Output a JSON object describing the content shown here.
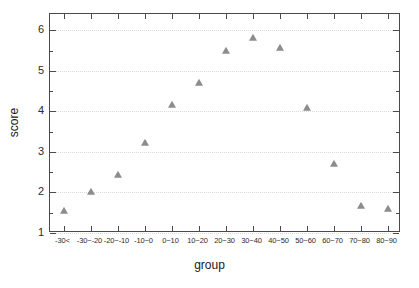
{
  "chart_data": {
    "type": "scatter",
    "title": "",
    "xlabel": "group",
    "ylabel": "score",
    "categories": [
      "-30<",
      "-30~-20",
      "-20~-10",
      "-10~0",
      "0~10",
      "10~20",
      "20~30",
      "30~40",
      "40~50",
      "50~60",
      "60~70",
      "70~80",
      "80~90"
    ],
    "values": [
      1.55,
      2.0,
      2.42,
      3.22,
      4.15,
      4.7,
      5.5,
      5.8,
      5.57,
      4.07,
      2.7,
      1.67,
      1.6
    ],
    "ylim": [
      1,
      6.4
    ],
    "ytick_labels": [
      "1",
      "2",
      "3",
      "4",
      "5",
      "6"
    ],
    "ytick_values": [
      1,
      2,
      3,
      4,
      5,
      6
    ],
    "yminor_values": [
      1.5,
      2.5,
      3.5,
      4.5,
      5.5,
      6
    ],
    "grid": true,
    "grid_axis": "y",
    "legend": "none",
    "marker": "triangle",
    "marker_color": "#8c8c8c",
    "axis_color": "#4a4a4a",
    "grid_color": "#dcdcdc",
    "background": "#ffffff"
  }
}
